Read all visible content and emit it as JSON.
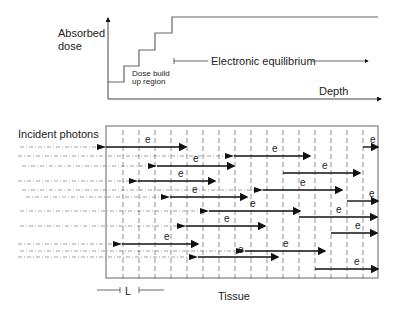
{
  "top_graph": {
    "y_label_line1": "Absorbed",
    "y_label_line2": "dose",
    "x_label": "Depth",
    "buildup_label_line1": "Dose build",
    "buildup_label_line2": "up region",
    "equilibrium_label": "Electronic equilibrium",
    "curve_points": [
      [
        108,
        82
      ],
      [
        124,
        82
      ],
      [
        124,
        66
      ],
      [
        139,
        66
      ],
      [
        139,
        50
      ],
      [
        155,
        50
      ],
      [
        155,
        33
      ],
      [
        172,
        33
      ],
      [
        172,
        17
      ],
      [
        378,
        17
      ]
    ]
  },
  "bottom_diagram": {
    "incident_label": "Incident photons",
    "tissue_label": "Tissue",
    "spacing_label": "L",
    "electron_label": "e",
    "box": {
      "x": 106,
      "y": 126,
      "w": 272,
      "h": 152
    },
    "grid_x": [
      123,
      139,
      155,
      171,
      187,
      203,
      219,
      235,
      251,
      267,
      283,
      299,
      315,
      331,
      347,
      363
    ],
    "photon_rows": [
      {
        "y": 147,
        "x_start": 20,
        "arrow_x": 106,
        "e_start": 106,
        "e_end": 186,
        "label_x": 145
      },
      {
        "y": 156,
        "x_start": 18,
        "arrow_x": 234,
        "e_start": 234,
        "e_end": 310,
        "label_x": 272
      },
      {
        "y": 166,
        "x_start": 22,
        "arrow_x": 157,
        "e_start": 157,
        "e_end": 234,
        "label_x": 193
      },
      {
        "y": 181,
        "x_start": 18,
        "arrow_x": 138,
        "e_start": 138,
        "e_end": 215,
        "label_x": 178
      },
      {
        "y": 190,
        "x_start": 22,
        "arrow_x": 263,
        "e_start": 263,
        "e_end": 342,
        "label_x": 300
      },
      {
        "y": 197,
        "x_start": 26,
        "arrow_x": 170,
        "e_start": 170,
        "e_end": 247,
        "label_x": 192
      },
      {
        "y": 211,
        "x_start": 20,
        "arrow_x": 209,
        "e_start": 209,
        "e_end": 300,
        "label_x": 250
      },
      {
        "y": 226,
        "x_start": 20,
        "arrow_x": 186,
        "e_start": 186,
        "e_end": 265,
        "label_x": 224
      },
      {
        "y": 244,
        "x_start": 18,
        "arrow_x": 122,
        "e_start": 122,
        "e_end": 198,
        "label_x": 164
      },
      {
        "y": 251,
        "x_start": 20,
        "arrow_x": 245,
        "e_start": 245,
        "e_end": 325,
        "label_x": 283
      },
      {
        "y": 257,
        "x_start": 18,
        "arrow_x": 198,
        "e_start": 198,
        "e_end": 278,
        "label_x": 238
      }
    ],
    "free_electrons": [
      {
        "y": 147,
        "x1": 363,
        "x2": 378,
        "label_x": 370
      },
      {
        "y": 173,
        "x1": 283,
        "x2": 360,
        "label_x": 322
      },
      {
        "y": 201,
        "x1": 347,
        "x2": 378,
        "label_x": 369
      },
      {
        "y": 217,
        "x1": 299,
        "x2": 377,
        "label_x": 336
      },
      {
        "y": 233,
        "x1": 331,
        "x2": 377,
        "label_x": 355
      },
      {
        "y": 269,
        "x1": 315,
        "x2": 378,
        "label_x": 354
      }
    ]
  }
}
